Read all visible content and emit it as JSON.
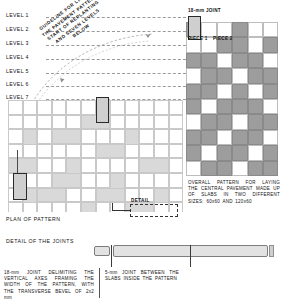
{
  "drawing": {
    "title": "Pavement slab laying pattern",
    "levels": [
      {
        "label": "LEVEL 1"
      },
      {
        "label": "LEVEL 2"
      },
      {
        "label": "LEVEL 3"
      },
      {
        "label": "LEVEL 4"
      },
      {
        "label": "LEVEL 5"
      },
      {
        "label": "LEVEL 6"
      },
      {
        "label": "LEVEL 7"
      }
    ],
    "guideline_note": {
      "line1": "GUIDELINE FOR LAYING",
      "line2": "THE PAVEMENT PATTERN",
      "line3": "START OF REPLANTING",
      "line4": "AND SEVEN LEVELS",
      "line5": "BELOW"
    },
    "labels": {
      "joint_18mm": "18-mm JOINT",
      "piece_1": "PIECE 1",
      "piece_2": "PIECE 2",
      "detail_callout": "DETAIL",
      "plan_of_pattern": "PLAN OF PATTERN",
      "detail_of_the_joints": "DETAIL OF THE JOINTS"
    },
    "notes": {
      "overall_pattern": "OVERALL PATTERN FOR LAYING THE CENTRAL PAVEMENT MADE UP OF SLABS IN TWO DIFFERENT SIZES: 60x60 AND 120x60",
      "joint_vertical": "18-mm JOINT DELIMITING THE VERTICAL AXES FRAMING THE WIDTH OF THE PATTERN, WITH THE TRANSVERSE BEVEL OF 2x2 mm",
      "joint_inner": "5-mm JOINT BETWEEN THE SLABS INSIDE THE PATTERN"
    },
    "colors": {
      "light_fill": "#d9d9d9",
      "dark_fill": "#9d9d9d",
      "void": "#ffffff",
      "line": "#c9c9c9",
      "ink": "#111111",
      "guide_dash": "#9a9a9a"
    },
    "dimensions": {
      "slab_size_a": "60x60",
      "slab_size_b": "120x60",
      "outer_joint_mm": "18",
      "inner_joint_mm": "5",
      "bevel_mm": "2x2"
    }
  }
}
